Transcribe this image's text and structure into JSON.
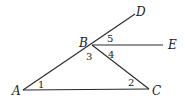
{
  "diagram": {
    "type": "geometry",
    "points": [
      {
        "id": "A",
        "label": "A"
      },
      {
        "id": "B",
        "label": "B"
      },
      {
        "id": "C",
        "label": "C"
      },
      {
        "id": "D",
        "label": "D"
      },
      {
        "id": "E",
        "label": "E"
      }
    ],
    "segments": [
      {
        "from": "A",
        "to": "D",
        "note": "ray A through B to D"
      },
      {
        "from": "B",
        "to": "E"
      },
      {
        "from": "B",
        "to": "C"
      },
      {
        "from": "A",
        "to": "C"
      }
    ],
    "angle_labels": [
      {
        "label": "1",
        "vertex": "A"
      },
      {
        "label": "2",
        "vertex": "C"
      },
      {
        "label": "3",
        "vertex": "B"
      },
      {
        "label": "4",
        "vertex": "B"
      },
      {
        "label": "5",
        "vertex": "B"
      }
    ]
  }
}
